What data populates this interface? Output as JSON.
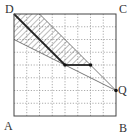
{
  "diagram": {
    "grid": {
      "cols": 8,
      "rows": 8
    },
    "square": {
      "left": 14,
      "top": 14,
      "size": 102
    },
    "labels": {
      "A": "A",
      "B": "B",
      "C": "C",
      "D": "D",
      "Q": "Q"
    },
    "points": {
      "D": [
        0,
        8
      ],
      "P": [
        4,
        4
      ],
      "R": [
        6,
        4
      ],
      "Q": [
        8,
        2
      ],
      "top_hatch": [
        2,
        8
      ],
      "left_hatch": [
        0,
        6
      ]
    },
    "hatched_region": [
      [
        0,
        8
      ],
      [
        2,
        8
      ],
      [
        6,
        4
      ],
      [
        4,
        4
      ],
      [
        0,
        6
      ]
    ],
    "colors": {
      "line": "#333333",
      "grid": "#999999",
      "hatch": "#555555"
    }
  }
}
